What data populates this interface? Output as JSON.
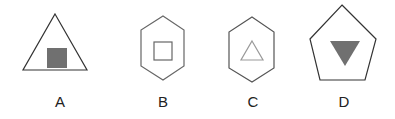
{
  "figure": {
    "options": [
      {
        "label": "A",
        "outer": "triangle",
        "inner": "square",
        "inner_style": "filled-gray"
      },
      {
        "label": "B",
        "outer": "hexagon",
        "inner": "square",
        "inner_style": "outline-gray"
      },
      {
        "label": "C",
        "outer": "hexagon",
        "inner": "triangle-up",
        "inner_style": "outline-light-gray"
      },
      {
        "label": "D",
        "outer": "pentagon",
        "inner": "triangle-down",
        "inner_style": "filled-gray"
      }
    ],
    "colors": {
      "outline": "#333333",
      "outline_gray": "#777777",
      "fill_gray": "#707070",
      "light_outline": "#999999"
    }
  }
}
